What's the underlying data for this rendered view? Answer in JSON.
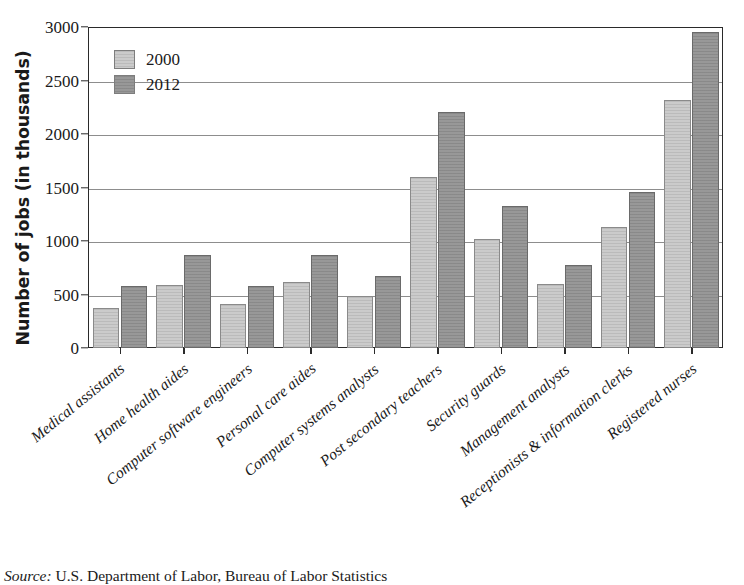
{
  "chart_data": {
    "type": "bar",
    "title": "",
    "xlabel": "",
    "ylabel": "Number of jobs (in thousands)",
    "ylim": [
      0,
      3000
    ],
    "ytick_values": [
      0,
      500,
      1000,
      1500,
      2000,
      2500,
      3000
    ],
    "ytick_labels": [
      "0",
      "500",
      "1000",
      "1500",
      "2000",
      "2500",
      "3000"
    ],
    "grid": true,
    "legend_position": "upper-left-inside",
    "categories": [
      "Medical assistants",
      "Home health aides",
      "Computer software engineers",
      "Personal care aides",
      "Computer systems analysts",
      "Post secondary teachers",
      "Security guards",
      "Management analysts",
      "Receptionists & information clerks",
      "Registered nurses"
    ],
    "series": [
      {
        "name": "2000",
        "color": "#cbcbcb",
        "values": [
          370,
          590,
          410,
          620,
          490,
          1600,
          1020,
          600,
          1130,
          2320
        ]
      },
      {
        "name": "2012",
        "color": "#989898",
        "values": [
          575,
          870,
          580,
          870,
          670,
          2205,
          1330,
          780,
          1460,
          2950
        ]
      }
    ]
  },
  "source": {
    "label": "Source:",
    "text": " U.S. Department of Labor, Bureau of Labor Statistics"
  }
}
